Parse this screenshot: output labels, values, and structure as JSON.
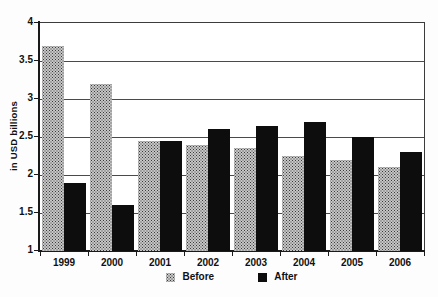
{
  "chart_data": {
    "type": "bar",
    "title": "",
    "xlabel": "",
    "ylabel": "in USD billions",
    "categories": [
      "1999",
      "2000",
      "2001",
      "2002",
      "2003",
      "2004",
      "2005",
      "2006"
    ],
    "series": [
      {
        "name": "Before",
        "style": "stipple-gray",
        "values": [
          3.7,
          3.2,
          2.45,
          2.4,
          2.35,
          2.25,
          2.2,
          2.1
        ]
      },
      {
        "name": "After",
        "style": "solid-black",
        "values": [
          1.9,
          1.6,
          2.45,
          2.6,
          2.65,
          2.7,
          2.5,
          2.3
        ]
      }
    ],
    "ylim": [
      1,
      4
    ],
    "y_tick_labels": [
      "1",
      "1.5",
      "2",
      "2.5",
      "3",
      "3.5",
      "4"
    ],
    "grid": "horizontal",
    "legend_position": "bottom-center"
  },
  "colors": {
    "background": "#ffffff",
    "axis": "#1a1a1a",
    "gridline": "#4a4a4a",
    "before_fill_base": "#c6c6c6",
    "before_dot": "#3a3a3a",
    "after_fill": "#0d0d0d",
    "text": "#111111"
  }
}
